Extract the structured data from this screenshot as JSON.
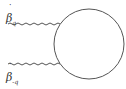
{
  "diagram": {
    "type": "feynman-loop",
    "labels": {
      "top": {
        "symbol": "β",
        "accent": "˙",
        "subscript": "q"
      },
      "bottom": {
        "symbol": "β",
        "accent": "˙",
        "subscript": "-q"
      }
    },
    "colors": {
      "line": "#555555",
      "background": "#ffffff"
    }
  }
}
